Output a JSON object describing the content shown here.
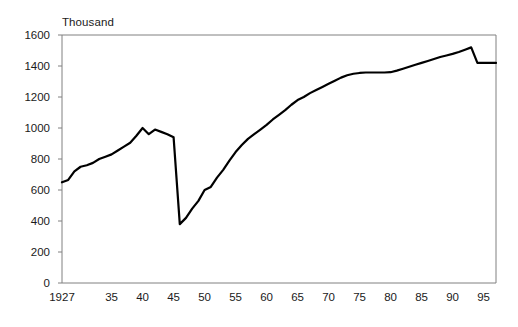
{
  "chart_data": {
    "type": "line",
    "title": "",
    "subtitle": "",
    "unit_label": "Thousand",
    "xlabel": "",
    "ylabel": "",
    "ylim": [
      0,
      1600
    ],
    "xlim": [
      1927,
      1997
    ],
    "ytick_values": [
      0,
      200,
      400,
      600,
      800,
      1000,
      1200,
      1400,
      1600
    ],
    "ytick_labels": [
      "0",
      "200",
      "400",
      "600",
      "800",
      "1000",
      "1200",
      "1400",
      "1600"
    ],
    "xtick_values": [
      1927,
      1935,
      1940,
      1945,
      1950,
      1955,
      1960,
      1965,
      1970,
      1975,
      1980,
      1985,
      1990,
      1995
    ],
    "xtick_labels": [
      "1927",
      "35",
      "40",
      "45",
      "50",
      "55",
      "60",
      "65",
      "70",
      "75",
      "80",
      "85",
      "90",
      "95"
    ],
    "grid": false,
    "legend": null,
    "legend_position": "none",
    "line_color": "#000000",
    "line_width": 2.2,
    "axis_color": "#808080",
    "background_color": "#ffffff",
    "series": [
      {
        "name": "",
        "x": [
          1927,
          1928,
          1929,
          1930,
          1931,
          1932,
          1933,
          1934,
          1935,
          1936,
          1937,
          1938,
          1939,
          1940,
          1941,
          1942,
          1943,
          1944,
          1945,
          1946,
          1947,
          1948,
          1949,
          1950,
          1951,
          1952,
          1953,
          1954,
          1955,
          1956,
          1957,
          1958,
          1959,
          1960,
          1961,
          1962,
          1963,
          1964,
          1965,
          1966,
          1967,
          1968,
          1969,
          1970,
          1971,
          1972,
          1973,
          1974,
          1975,
          1976,
          1977,
          1978,
          1979,
          1980,
          1981,
          1982,
          1983,
          1984,
          1985,
          1986,
          1987,
          1988,
          1989,
          1990,
          1991,
          1992,
          1993,
          1994,
          1995,
          1996,
          1997
        ],
        "y": [
          650,
          665,
          720,
          750,
          760,
          775,
          800,
          815,
          830,
          855,
          880,
          905,
          950,
          1000,
          960,
          990,
          975,
          960,
          940,
          380,
          420,
          480,
          530,
          600,
          620,
          680,
          730,
          790,
          845,
          890,
          930,
          960,
          990,
          1020,
          1055,
          1085,
          1115,
          1150,
          1180,
          1200,
          1225,
          1245,
          1265,
          1285,
          1305,
          1325,
          1340,
          1350,
          1355,
          1358,
          1358,
          1358,
          1358,
          1360,
          1370,
          1382,
          1395,
          1408,
          1420,
          1432,
          1445,
          1458,
          1468,
          1478,
          1490,
          1505,
          1520,
          1420,
          1420,
          1420,
          1420
        ]
      }
    ],
    "annotations": [
      {
        "text": "peak-1940",
        "x": 1940,
        "y": 1000
      },
      {
        "text": "trough-1945",
        "x": 1945,
        "y": 380
      },
      {
        "text": "peak-1993",
        "x": 1993,
        "y": 1520
      }
    ]
  },
  "plot_geometry": {
    "left": 62,
    "right": 496,
    "top": 35,
    "bottom": 283
  }
}
